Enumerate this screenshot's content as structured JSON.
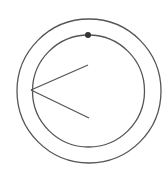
{
  "diagram": {
    "stroke_color": "#555555",
    "dot_color": "#333333",
    "background": "#ffffff",
    "outer_circle": {
      "cx": 89,
      "cy": 91,
      "r": 72
    },
    "inner_circle": {
      "cx": 88.5,
      "cy": 91,
      "r": 56
    },
    "dot": {
      "cx": 88,
      "cy": 35,
      "r": 3
    },
    "angle": {
      "vertex": {
        "x": 31,
        "y": 90
      },
      "ray_upper_end": {
        "x": 88,
        "y": 65
      },
      "ray_lower_end": {
        "x": 89,
        "y": 118
      }
    }
  }
}
